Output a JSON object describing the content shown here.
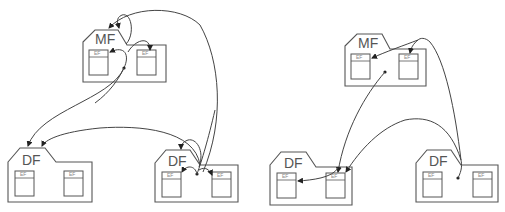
{
  "diagram": {
    "left": {
      "mf": {
        "label": "MF",
        "ef_left": "EF",
        "ef_right": "EF"
      },
      "df_left": {
        "label": "DF",
        "ef_left": "EF",
        "ef_right": "EF"
      },
      "df_right": {
        "label": "DF",
        "ef_left": "EF",
        "ef_right": "EF"
      }
    },
    "right": {
      "mf": {
        "label": "MF",
        "ef_left": "EF",
        "ef_right": "EF"
      },
      "df_left": {
        "label": "DF",
        "ef_left": "EF",
        "ef_right": "EF"
      },
      "df_right": {
        "label": "DF",
        "ef_left": "EF",
        "ef_right": "EF"
      }
    },
    "colors": {
      "stroke": "#555555",
      "arrow": "#222222",
      "background": "#ffffff"
    }
  }
}
